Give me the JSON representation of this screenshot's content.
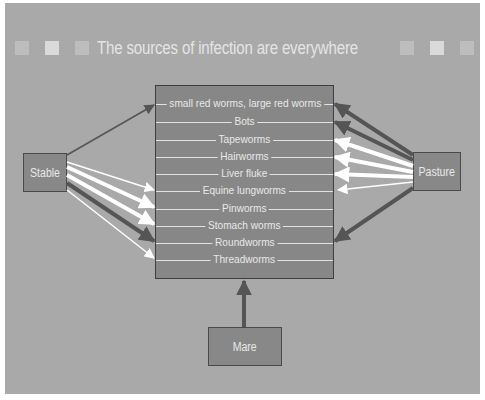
{
  "title": "The sources of infection are everywhere",
  "colors": {
    "background": "#a9a9a9",
    "box_fill": "#888888",
    "box_border": "#4a4a4a",
    "arrow_dark": "#5a5a5a",
    "arrow_light": "#ffffff",
    "square_mid": "#bdbdbd",
    "square_light": "#dadada"
  },
  "sources": {
    "stable": "Stable",
    "pasture": "Pasture",
    "mare": "Mare"
  },
  "parasites": [
    "small red worms, large red worms",
    "Bots",
    "Tapeworms",
    "Hairworms",
    "Liver fluke",
    "Equine lungworms",
    "Pinworms",
    "Stomach worms",
    "Roundworms",
    "Threadworms"
  ],
  "connections": {
    "stable": [
      {
        "target": "small red worms, large red worms",
        "style": "dark-thin"
      },
      {
        "target": "Equine lungworms",
        "style": "light-thin"
      },
      {
        "target": "Pinworms",
        "style": "light-thick"
      },
      {
        "target": "Stomach worms",
        "style": "light-thick"
      },
      {
        "target": "Roundworms",
        "style": "dark-thick"
      },
      {
        "target": "Threadworms",
        "style": "light-thin"
      }
    ],
    "pasture": [
      {
        "target": "small red worms, large red worms",
        "style": "dark-thick"
      },
      {
        "target": "Bots",
        "style": "dark-thick"
      },
      {
        "target": "Tapeworms",
        "style": "light-thick"
      },
      {
        "target": "Hairworms",
        "style": "light-thick"
      },
      {
        "target": "Liver fluke",
        "style": "light-thick"
      },
      {
        "target": "Equine lungworms",
        "style": "light-thin"
      },
      {
        "target": "Roundworms",
        "style": "dark-thick"
      }
    ],
    "mare": [
      {
        "target": "all parasites box",
        "style": "dark-thick"
      }
    ]
  }
}
